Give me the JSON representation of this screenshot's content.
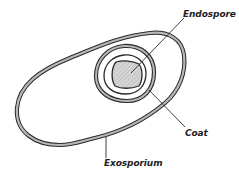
{
  "diagram": {
    "labels": {
      "endospore": "Endospore",
      "coat": "Coat",
      "exosporium": "Exosporium"
    },
    "colors": {
      "stroke": "#2a2a2a",
      "band_fill": "#b8b8b8",
      "core_fill": "#d4d4d4",
      "background": "#ffffff"
    }
  }
}
